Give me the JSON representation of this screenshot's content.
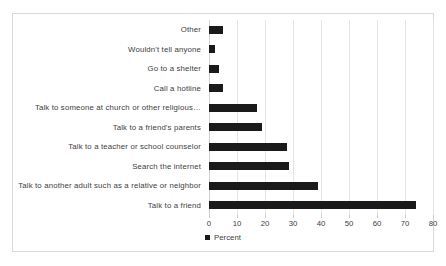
{
  "chart_data": {
    "type": "bar",
    "orientation": "horizontal",
    "title": "",
    "xlabel": "",
    "ylabel": "",
    "xlim": [
      0,
      80
    ],
    "xticks": [
      "0",
      "10",
      "20",
      "30",
      "40",
      "50",
      "60",
      "70",
      "80"
    ],
    "grid": true,
    "legend_position": "bottom",
    "legend": [
      "Percent"
    ],
    "series_color": "#1a1a1a",
    "categories": [
      "Other",
      "Wouldn't tell anyone",
      "Go to a shelter",
      "Call a hotline",
      "Talk to someone at church or other religious…",
      "Talk to a friend's parents",
      "Talk to a teacher or school counselor",
      "Search the internet",
      "Talk to another adult such as a relative or neighbor",
      "Talk to a friend"
    ],
    "values": [
      5,
      2,
      3.5,
      5,
      17,
      19,
      28,
      28.5,
      39,
      74
    ],
    "series": [
      {
        "name": "Percent",
        "values": [
          5,
          2,
          3.5,
          5,
          17,
          19,
          28,
          28.5,
          39,
          74
        ]
      }
    ]
  },
  "legend": {
    "label": "Percent"
  }
}
